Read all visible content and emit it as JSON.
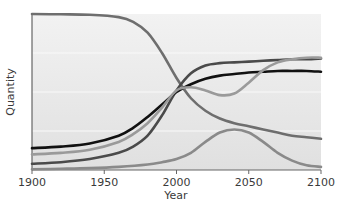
{
  "chart_data": {
    "type": "line",
    "title": "",
    "xlabel": "Year",
    "ylabel": "Quantity",
    "xlim": [
      1900,
      2100
    ],
    "ylim": [
      0,
      100
    ],
    "x_ticks": [
      1900,
      1950,
      2000,
      2050,
      2100
    ],
    "y_ticks": [],
    "grid": {
      "horizontal": true,
      "vertical": false,
      "y_positions": [
        25,
        50,
        75
      ]
    },
    "legend": null,
    "background_color": "#e6e6e6",
    "series": [
      {
        "name": "declining curve",
        "color": "#6e6e6e",
        "x": [
          1900,
          1920,
          1940,
          1960,
          1970,
          1980,
          1990,
          2000,
          2010,
          2020,
          2030,
          2040,
          2050,
          2060,
          2070,
          2080,
          2090,
          2100
        ],
        "values": [
          100,
          99.8,
          99.5,
          98,
          95,
          88,
          75,
          59,
          46,
          38,
          33,
          30,
          28,
          26,
          24,
          22,
          21,
          20
        ]
      },
      {
        "name": "dark s-curve",
        "color": "#4a4a4a",
        "x": [
          1900,
          1920,
          1940,
          1960,
          1970,
          1980,
          1990,
          2000,
          2010,
          2020,
          2030,
          2040,
          2050,
          2060,
          2070,
          2080,
          2090,
          2100
        ],
        "values": [
          4,
          5,
          7,
          11,
          15,
          22,
          35,
          51,
          62,
          67,
          68.5,
          69,
          69.5,
          70,
          70.5,
          71,
          71,
          71.5
        ]
      },
      {
        "name": "black s-curve",
        "color": "#111111",
        "x": [
          1900,
          1920,
          1940,
          1960,
          1970,
          1980,
          1990,
          2000,
          2010,
          2020,
          2030,
          2040,
          2050,
          2060,
          2070,
          2080,
          2090,
          2100
        ],
        "values": [
          14,
          15,
          17,
          22,
          27,
          34,
          42,
          50,
          55,
          58.5,
          60.5,
          61.5,
          62.5,
          63,
          63.5,
          63.5,
          63.5,
          63
        ]
      },
      {
        "name": "light curve with dip",
        "color": "#9a9a9a",
        "x": [
          1900,
          1920,
          1940,
          1960,
          1970,
          1980,
          1990,
          2000,
          2010,
          2020,
          2030,
          2040,
          2050,
          2060,
          2070,
          2080,
          2090,
          2100
        ],
        "values": [
          10,
          11,
          13,
          18,
          23,
          30,
          40,
          51,
          53,
          51,
          48,
          49,
          56,
          64,
          69,
          71,
          72,
          72
        ]
      },
      {
        "name": "bottom bump curve",
        "color": "#8a8a8a",
        "x": [
          1900,
          1920,
          1940,
          1960,
          1980,
          1990,
          2000,
          2010,
          2020,
          2030,
          2040,
          2050,
          2060,
          2070,
          2080,
          2090,
          2100
        ],
        "values": [
          0.5,
          0.8,
          1.2,
          2,
          3.5,
          5,
          7,
          11,
          18,
          24,
          26,
          24,
          18,
          11,
          6,
          3,
          2
        ]
      }
    ]
  }
}
